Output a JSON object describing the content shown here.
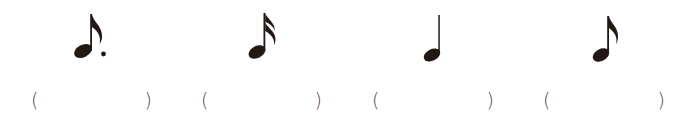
{
  "colors": {
    "note": "#231815",
    "paren": "#4a4a4a"
  },
  "items": [
    {
      "note": "dotted-eighth-note",
      "open": "(",
      "close": ")",
      "answer": ""
    },
    {
      "note": "sixteenth-note",
      "open": "(",
      "close": ")",
      "answer": ""
    },
    {
      "note": "quarter-note",
      "open": "(",
      "close": ")",
      "answer": ""
    },
    {
      "note": "eighth-note",
      "open": "(",
      "close": ")",
      "answer": ""
    }
  ]
}
